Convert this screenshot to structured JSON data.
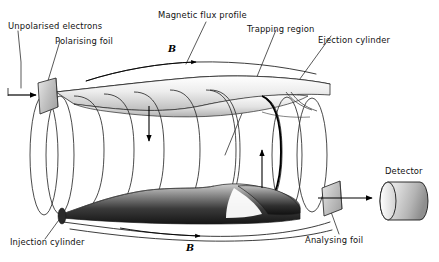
{
  "figure": {
    "background": "#ffffff",
    "width": 439,
    "height": 262
  },
  "labels": {
    "unpolarised_electrons": "Unpolarised electrons",
    "polarising_foil": "Polarising foil",
    "magnetic_flux_profile": "Magnetic flux profile",
    "trapping_region": "Trapping region",
    "ejection_cylinder": "Ejection cylinder",
    "injection_cylinder": "Injection cylinder",
    "analysing_foil": "Analysing foil",
    "detector": "Detector",
    "b_field_top": "B",
    "b_field_bottom": "B"
  },
  "colors": {
    "ink": "#111111",
    "stroke": "#222222",
    "foil_fill": "#c9c9c9",
    "detector_light": "#f2f2f2",
    "detector_dark": "#9a9a9a",
    "injection_dark": "#1d1d1d",
    "injection_light": "#d8d8d8",
    "ejection_light": "#fbfbfb",
    "ejection_mid": "#c4c4c4"
  },
  "elements": {
    "coil_turns": 9,
    "flux_arrow_top": "arrow-right",
    "flux_arrow_bottom": "arrow-right",
    "interior_arrow_left": "arrow-down",
    "interior_arrow_right": "arrow-up",
    "beam_in_arrow": "arrow-right",
    "beam_out_arrow": "arrow-right"
  }
}
